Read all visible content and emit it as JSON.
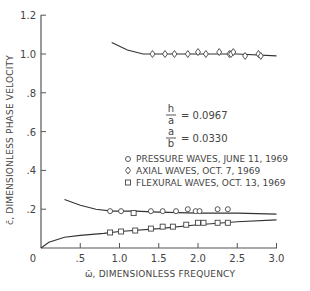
{
  "chart_data": {
    "type": "scatter",
    "title": "",
    "xlabel": "ω̄, DIMENSIONLESS FREQUENCY",
    "ylabel": "c̄, DIMENSIONLESS PHASE VELOCITY",
    "xlim": [
      0,
      3.0
    ],
    "ylim": [
      0,
      1.2
    ],
    "grid": false,
    "x_ticks": [
      "0",
      ".5",
      "1.0",
      "1.5",
      "2.0",
      "2.5",
      "3.0"
    ],
    "y_ticks": [
      ".2",
      ".4",
      ".6",
      ".8",
      "1.0",
      "1.2"
    ],
    "parameters": [
      {
        "num": "h",
        "den": "a",
        "value": "= 0.0967"
      },
      {
        "num": "a",
        "den": "b",
        "value": "= 0.0330"
      }
    ],
    "legend": [
      {
        "marker": "circle",
        "label": "PRESSURE WAVES, JUNE 11, 1969"
      },
      {
        "marker": "diamond",
        "label": "AXIAL WAVES, OCT. 7, 1969"
      },
      {
        "marker": "square",
        "label": "FLEXURAL WAVES, OCT. 13, 1969"
      }
    ],
    "series": [
      {
        "name": "AXIAL WAVES, OCT. 7, 1969",
        "marker": "diamond",
        "x": [
          1.42,
          1.58,
          1.7,
          1.87,
          2.0,
          2.1,
          2.27,
          2.4,
          2.42,
          2.45,
          2.6,
          2.77,
          2.8
        ],
        "y": [
          1.0,
          1.0,
          1.0,
          1.0,
          1.01,
          1.0,
          1.01,
          1.0,
          1.0,
          1.01,
          0.99,
          1.0,
          0.99
        ]
      },
      {
        "name": "PRESSURE WAVES, JUNE 11, 1969",
        "marker": "circle",
        "x": [
          0.88,
          1.02,
          1.4,
          1.55,
          1.72,
          1.87,
          1.97,
          2.02,
          2.25,
          2.38
        ],
        "y": [
          0.19,
          0.19,
          0.19,
          0.19,
          0.19,
          0.2,
          0.19,
          0.19,
          0.2,
          0.2
        ]
      },
      {
        "name": "FLEXURAL WAVES, OCT. 13, 1969",
        "marker": "square",
        "x": [
          0.88,
          1.02,
          1.2,
          1.4,
          1.55,
          1.68,
          1.85,
          2.0,
          2.07,
          2.25,
          2.38
        ],
        "y": [
          0.08,
          0.085,
          0.09,
          0.1,
          0.11,
          0.11,
          0.12,
          0.13,
          0.13,
          0.13,
          0.13
        ],
        "alt_y_note": "",
        "extra": [
          {
            "x": 1.18,
            "y": 0.18
          }
        ]
      }
    ],
    "curves": [
      {
        "name": "axial theory",
        "x": [
          0.9,
          1.1,
          1.3,
          1.5,
          2.0,
          2.5,
          3.0
        ],
        "y": [
          1.06,
          1.02,
          1.0,
          1.0,
          1.0,
          1.0,
          0.99
        ]
      },
      {
        "name": "pressure theory",
        "x": [
          0.3,
          0.5,
          0.7,
          0.9,
          1.2,
          1.5,
          2.0,
          2.5,
          3.0
        ],
        "y": [
          0.25,
          0.22,
          0.2,
          0.19,
          0.19,
          0.185,
          0.18,
          0.18,
          0.175
        ]
      },
      {
        "name": "flexural theory",
        "x": [
          0.0,
          0.1,
          0.3,
          0.5,
          0.8,
          1.0,
          1.5,
          2.0,
          2.5,
          3.0
        ],
        "y": [
          0.0,
          0.03,
          0.055,
          0.065,
          0.075,
          0.085,
          0.1,
          0.12,
          0.135,
          0.145
        ]
      }
    ]
  },
  "labels": {
    "origin": "0",
    "xlabel": "ω̄, DIMENSIONLESS FREQUENCY",
    "ylabel": "c̄, DIMENSIONLESS PHASE VELOCITY",
    "param1_num": "h",
    "param1_den": "a",
    "param1_val": "= 0.0967",
    "param2_num": "a",
    "param2_den": "b",
    "param2_val": "= 0.0330",
    "legend1": "PRESSURE WAVES, JUNE 11, 1969",
    "legend2": "AXIAL WAVES, OCT. 7, 1969",
    "legend3": "FLEXURAL WAVES, OCT. 13, 1969"
  }
}
